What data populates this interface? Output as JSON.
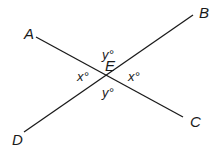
{
  "diagram": {
    "points": {
      "A": {
        "label": "A",
        "x": 28,
        "y": 34
      },
      "B": {
        "label": "B",
        "x": 204,
        "y": 14
      },
      "C": {
        "label": "C",
        "x": 195,
        "y": 124
      },
      "D": {
        "label": "D",
        "x": 18,
        "y": 142
      },
      "E": {
        "label": "E",
        "x": 110,
        "y": 70
      }
    },
    "lines": [
      {
        "from": "A",
        "to": "C",
        "x1": 36,
        "y1": 37,
        "x2": 183,
        "y2": 117
      },
      {
        "from": "D",
        "to": "B",
        "x1": 24,
        "y1": 132,
        "x2": 193,
        "y2": 15
      }
    ],
    "angles": {
      "top": {
        "label": "y°",
        "x": 104,
        "y": 56
      },
      "left": {
        "label": "x°",
        "x": 78,
        "y": 78
      },
      "right": {
        "label": "x°",
        "x": 129,
        "y": 79
      },
      "bottom": {
        "label": "y°",
        "x": 104,
        "y": 96
      }
    },
    "line_color": "#1a1a1a"
  }
}
